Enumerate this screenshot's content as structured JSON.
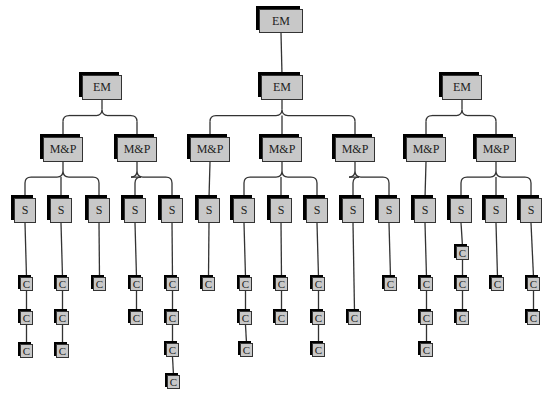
{
  "diagram": {
    "type": "organization-tree",
    "colors": {
      "node_fill": "#c8c8c8",
      "node_shadow": "#000000",
      "edge": "#333333",
      "background": "#ffffff"
    },
    "nodes": [
      {
        "id": "root",
        "label": "EM",
        "x": 259,
        "y": 9,
        "w": 44,
        "h": 24,
        "size": "big"
      },
      {
        "id": "emL",
        "label": "EM",
        "x": 82,
        "y": 75,
        "w": 40,
        "h": 25,
        "size": "big",
        "parent": "root_hidden"
      },
      {
        "id": "emM",
        "label": "EM",
        "x": 261,
        "y": 75,
        "w": 42,
        "h": 25,
        "size": "big",
        "parent": "root"
      },
      {
        "id": "emR",
        "label": "EM",
        "x": 442,
        "y": 75,
        "w": 40,
        "h": 25,
        "size": "big",
        "parent": "root_hidden"
      },
      {
        "id": "mp1",
        "label": "M&P",
        "x": 43,
        "y": 137,
        "w": 40,
        "h": 25,
        "size": "big",
        "parent": "emL"
      },
      {
        "id": "mp2",
        "label": "M&P",
        "x": 117,
        "y": 137,
        "w": 40,
        "h": 25,
        "size": "big",
        "parent": "emL"
      },
      {
        "id": "mp3",
        "label": "M&P",
        "x": 190,
        "y": 137,
        "w": 40,
        "h": 25,
        "size": "big",
        "parent": "emM"
      },
      {
        "id": "mp4",
        "label": "M&P",
        "x": 262,
        "y": 137,
        "w": 40,
        "h": 25,
        "size": "big",
        "parent": "emM"
      },
      {
        "id": "mp5",
        "label": "M&P",
        "x": 335,
        "y": 137,
        "w": 40,
        "h": 25,
        "size": "big",
        "parent": "emM"
      },
      {
        "id": "mp6",
        "label": "M&P",
        "x": 406,
        "y": 137,
        "w": 40,
        "h": 25,
        "size": "big",
        "parent": "emR"
      },
      {
        "id": "mp7",
        "label": "M&P",
        "x": 476,
        "y": 137,
        "w": 40,
        "h": 25,
        "size": "big",
        "parent": "emR"
      },
      {
        "id": "s1",
        "label": "S",
        "x": 14,
        "y": 198,
        "w": 22,
        "h": 25,
        "size": "big",
        "parent": "mp1"
      },
      {
        "id": "s2",
        "label": "S",
        "x": 50,
        "y": 198,
        "w": 22,
        "h": 25,
        "size": "big",
        "parent": "mp1"
      },
      {
        "id": "s3",
        "label": "S",
        "x": 88,
        "y": 198,
        "w": 22,
        "h": 25,
        "size": "big",
        "parent": "mp1"
      },
      {
        "id": "s4",
        "label": "S",
        "x": 124,
        "y": 198,
        "w": 22,
        "h": 25,
        "size": "big",
        "parent": "mp2"
      },
      {
        "id": "s5",
        "label": "S",
        "x": 161,
        "y": 198,
        "w": 22,
        "h": 25,
        "size": "big",
        "parent": "mp2"
      },
      {
        "id": "s6",
        "label": "S",
        "x": 198,
        "y": 198,
        "w": 22,
        "h": 25,
        "size": "big",
        "parent": "mp3"
      },
      {
        "id": "s7",
        "label": "S",
        "x": 233,
        "y": 198,
        "w": 22,
        "h": 25,
        "size": "big",
        "parent": "mp4"
      },
      {
        "id": "s8",
        "label": "S",
        "x": 270,
        "y": 198,
        "w": 22,
        "h": 25,
        "size": "big",
        "parent": "mp4"
      },
      {
        "id": "s9",
        "label": "S",
        "x": 306,
        "y": 198,
        "w": 22,
        "h": 25,
        "size": "big",
        "parent": "mp4"
      },
      {
        "id": "s10",
        "label": "S",
        "x": 342,
        "y": 198,
        "w": 22,
        "h": 25,
        "size": "big",
        "parent": "mp5"
      },
      {
        "id": "s11",
        "label": "S",
        "x": 378,
        "y": 198,
        "w": 22,
        "h": 25,
        "size": "big",
        "parent": "mp5"
      },
      {
        "id": "s12",
        "label": "S",
        "x": 414,
        "y": 198,
        "w": 22,
        "h": 25,
        "size": "big",
        "parent": "mp6"
      },
      {
        "id": "s13",
        "label": "S",
        "x": 450,
        "y": 198,
        "w": 22,
        "h": 25,
        "size": "big",
        "parent": "mp7"
      },
      {
        "id": "s14",
        "label": "S",
        "x": 485,
        "y": 198,
        "w": 22,
        "h": 25,
        "size": "big",
        "parent": "mp7"
      },
      {
        "id": "s15",
        "label": "S",
        "x": 520,
        "y": 198,
        "w": 22,
        "h": 25,
        "size": "big",
        "parent": "mp7"
      },
      {
        "id": "c1a",
        "label": "C",
        "x": 20,
        "y": 277,
        "w": 13,
        "h": 14,
        "size": "small",
        "parent": "s1"
      },
      {
        "id": "c1b",
        "label": "C",
        "x": 20,
        "y": 311,
        "w": 13,
        "h": 14,
        "size": "small",
        "parent": "c1a"
      },
      {
        "id": "c1c",
        "label": "C",
        "x": 20,
        "y": 344,
        "w": 13,
        "h": 14,
        "size": "small",
        "parent": "c1b"
      },
      {
        "id": "c2a",
        "label": "C",
        "x": 56,
        "y": 277,
        "w": 13,
        "h": 14,
        "size": "small",
        "parent": "s2"
      },
      {
        "id": "c2b",
        "label": "C",
        "x": 56,
        "y": 311,
        "w": 13,
        "h": 14,
        "size": "small",
        "parent": "c2a"
      },
      {
        "id": "c2c",
        "label": "C",
        "x": 56,
        "y": 344,
        "w": 13,
        "h": 14,
        "size": "small",
        "parent": "c2b"
      },
      {
        "id": "c3a",
        "label": "C",
        "x": 93,
        "y": 277,
        "w": 13,
        "h": 14,
        "size": "small",
        "parent": "s3"
      },
      {
        "id": "c4a",
        "label": "C",
        "x": 130,
        "y": 277,
        "w": 13,
        "h": 14,
        "size": "small",
        "parent": "s4"
      },
      {
        "id": "c4b",
        "label": "C",
        "x": 130,
        "y": 311,
        "w": 13,
        "h": 14,
        "size": "small",
        "parent": "c4a"
      },
      {
        "id": "c5a",
        "label": "C",
        "x": 166,
        "y": 277,
        "w": 13,
        "h": 14,
        "size": "small",
        "parent": "s5"
      },
      {
        "id": "c5b",
        "label": "C",
        "x": 166,
        "y": 311,
        "w": 13,
        "h": 14,
        "size": "small",
        "parent": "c5a"
      },
      {
        "id": "c5c",
        "label": "C",
        "x": 166,
        "y": 343,
        "w": 13,
        "h": 14,
        "size": "small",
        "parent": "c5b"
      },
      {
        "id": "c5d",
        "label": "C",
        "x": 167,
        "y": 375,
        "w": 13,
        "h": 14,
        "size": "small",
        "parent": "c5c"
      },
      {
        "id": "c6a",
        "label": "C",
        "x": 202,
        "y": 277,
        "w": 13,
        "h": 14,
        "size": "small",
        "parent": "s6"
      },
      {
        "id": "c7a",
        "label": "C",
        "x": 239,
        "y": 277,
        "w": 13,
        "h": 14,
        "size": "small",
        "parent": "s7"
      },
      {
        "id": "c7b",
        "label": "C",
        "x": 239,
        "y": 311,
        "w": 13,
        "h": 14,
        "size": "small",
        "parent": "c7a"
      },
      {
        "id": "c7c",
        "label": "C",
        "x": 240,
        "y": 343,
        "w": 13,
        "h": 14,
        "size": "small",
        "parent": "c7b"
      },
      {
        "id": "c8a",
        "label": "C",
        "x": 275,
        "y": 277,
        "w": 13,
        "h": 14,
        "size": "small",
        "parent": "s8"
      },
      {
        "id": "c8b",
        "label": "C",
        "x": 275,
        "y": 311,
        "w": 13,
        "h": 14,
        "size": "small",
        "parent": "c8a"
      },
      {
        "id": "c9a",
        "label": "C",
        "x": 312,
        "y": 277,
        "w": 13,
        "h": 14,
        "size": "small",
        "parent": "s9"
      },
      {
        "id": "c9b",
        "label": "C",
        "x": 312,
        "y": 311,
        "w": 13,
        "h": 14,
        "size": "small",
        "parent": "c9a"
      },
      {
        "id": "c9c",
        "label": "C",
        "x": 312,
        "y": 343,
        "w": 13,
        "h": 14,
        "size": "small",
        "parent": "c9b"
      },
      {
        "id": "c10a",
        "label": "C",
        "x": 348,
        "y": 311,
        "w": 13,
        "h": 14,
        "size": "small",
        "parent": "s10"
      },
      {
        "id": "c11a",
        "label": "C",
        "x": 384,
        "y": 277,
        "w": 13,
        "h": 14,
        "size": "small",
        "parent": "s11"
      },
      {
        "id": "c12a",
        "label": "C",
        "x": 420,
        "y": 277,
        "w": 13,
        "h": 14,
        "size": "small",
        "parent": "s12"
      },
      {
        "id": "c12b",
        "label": "C",
        "x": 420,
        "y": 311,
        "w": 13,
        "h": 14,
        "size": "small",
        "parent": "c12a"
      },
      {
        "id": "c12c",
        "label": "C",
        "x": 420,
        "y": 343,
        "w": 13,
        "h": 14,
        "size": "small",
        "parent": "c12b"
      },
      {
        "id": "c13a",
        "label": "C",
        "x": 456,
        "y": 246,
        "w": 13,
        "h": 14,
        "size": "small",
        "parent": "s13"
      },
      {
        "id": "c13b",
        "label": "C",
        "x": 456,
        "y": 277,
        "w": 13,
        "h": 14,
        "size": "small",
        "parent": "c13a"
      },
      {
        "id": "c13c",
        "label": "C",
        "x": 456,
        "y": 311,
        "w": 13,
        "h": 14,
        "size": "small",
        "parent": "c13b"
      },
      {
        "id": "c14a",
        "label": "C",
        "x": 491,
        "y": 277,
        "w": 13,
        "h": 14,
        "size": "small",
        "parent": "s14"
      },
      {
        "id": "c15a",
        "label": "C",
        "x": 527,
        "y": 277,
        "w": 13,
        "h": 14,
        "size": "small",
        "parent": "s15"
      },
      {
        "id": "c15b",
        "label": "C",
        "x": 527,
        "y": 311,
        "w": 13,
        "h": 14,
        "size": "small",
        "parent": "c15a"
      }
    ]
  }
}
